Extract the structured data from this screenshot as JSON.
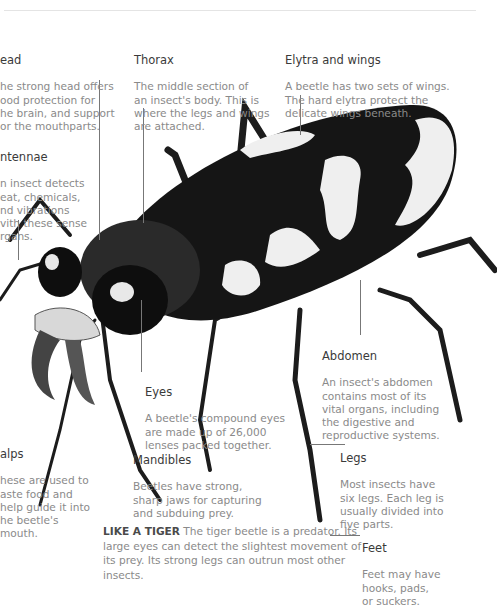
{
  "page": {
    "labels": {
      "head": {
        "title": "ead",
        "body": "he strong head offers\nood protection for\nhe brain, and support\nor the mouthparts."
      },
      "thorax": {
        "title": "Thorax",
        "body": "The middle section of\nan insect's body. This is\nwhere the legs and wings\nare attached."
      },
      "elytra": {
        "title": "Elytra and wings",
        "body": "A beetle has two sets of wings.\nThe hard elytra protect the\ndelicate wings beneath."
      },
      "antennae": {
        "title": "ntennae",
        "body": "n insect detects\neat, chemicals,\nnd vibrations\nvith these sense\nrgans."
      },
      "abdomen": {
        "title": "Abdomen",
        "body": "An insect's abdomen\ncontains most of its\nvital organs, including\nthe digestive and\nreproductive systems."
      },
      "eyes": {
        "title": "Eyes",
        "body": "A beetle's compound eyes\nare made up of 26,000\nlenses packed together."
      },
      "palps": {
        "title": "alps",
        "body": "hese are used to\naste food and\nhelp guide it into\nhe beetle's\nmouth."
      },
      "mandibles": {
        "title": "Mandibles",
        "body": "Beetles have strong,\nsharp jaws for capturing\nand subduing prey."
      },
      "legs": {
        "title": "Legs",
        "body": "Most insects have\nsix legs. Each leg is\nusually divided into\nfive parts."
      },
      "feet": {
        "title": "Feet",
        "body": "Feet may have\nhooks, pads,\nor suckers."
      }
    },
    "caption": {
      "bold": "LIKE A TIGER",
      "text": " The tiger beetle is a predator. Its large eyes can detect the slightest movement of its prey. Its strong legs can outrun most other insects."
    },
    "illustration": {
      "subject": "tiger-beetle-illustration"
    }
  }
}
